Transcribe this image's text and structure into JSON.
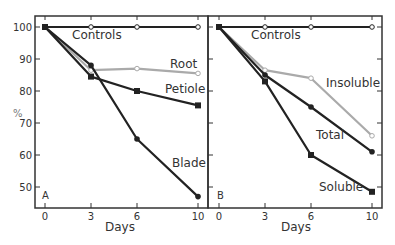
{
  "chart_data": [
    {
      "type": "line",
      "panel": "A",
      "title": "",
      "xlabel": "Days",
      "ylabel": "%",
      "x": [
        0,
        3,
        6,
        10
      ],
      "xticks": [
        "0",
        "3",
        "6",
        "10"
      ],
      "yticks": [
        "50",
        "60",
        "70",
        "80",
        "90",
        "100"
      ],
      "ylim": [
        44,
        103
      ],
      "grid": false,
      "series": [
        {
          "name": "Controls",
          "values": [
            100,
            100,
            100,
            100
          ],
          "color": "#222222",
          "marker": "open-circle"
        },
        {
          "name": "Root",
          "values": [
            100,
            86.5,
            87,
            85.5
          ],
          "color": "#aaaaaa",
          "marker": "open-circle"
        },
        {
          "name": "Petiole",
          "values": [
            100,
            84.5,
            80,
            75.5
          ],
          "color": "#222222",
          "marker": "filled-square"
        },
        {
          "name": "Blade",
          "values": [
            100,
            88,
            65,
            47
          ],
          "color": "#222222",
          "marker": "filled-circle"
        }
      ]
    },
    {
      "type": "line",
      "panel": "B",
      "title": "",
      "xlabel": "Days",
      "ylabel": "",
      "x": [
        0,
        3,
        6,
        10
      ],
      "xticks": [
        "0",
        "3",
        "6",
        "10"
      ],
      "yticks": [],
      "ylim": [
        44,
        103
      ],
      "grid": false,
      "series": [
        {
          "name": "Controls",
          "values": [
            100,
            100,
            100,
            100
          ],
          "color": "#222222",
          "marker": "open-circle"
        },
        {
          "name": "Insoluble",
          "values": [
            100,
            86.5,
            84,
            66
          ],
          "color": "#aaaaaa",
          "marker": "open-circle"
        },
        {
          "name": "Total",
          "values": [
            100,
            85,
            75,
            61
          ],
          "color": "#222222",
          "marker": "filled-circle"
        },
        {
          "name": "Soluble",
          "values": [
            100,
            83,
            60,
            48.5
          ],
          "color": "#222222",
          "marker": "filled-square"
        }
      ]
    }
  ],
  "panels": {
    "a": {
      "letter": "A",
      "xlabel": "Days",
      "ylabel": "%"
    },
    "b": {
      "letter": "B",
      "xlabel": "Days"
    }
  }
}
